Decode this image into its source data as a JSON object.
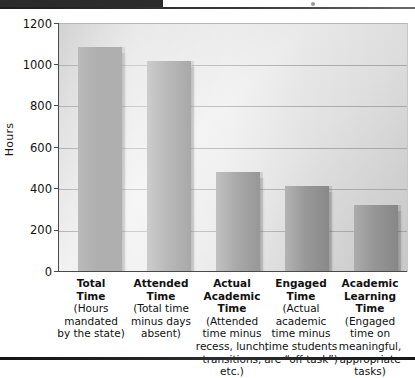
{
  "chart_data": {
    "type": "bar",
    "title": "",
    "xlabel": "",
    "ylabel": "Hours",
    "ylim": [
      0,
      1200
    ],
    "yticks": [
      0,
      200,
      400,
      600,
      800,
      1000,
      1200
    ],
    "ytick_labels": [
      "0",
      "200",
      "400",
      "600",
      "800",
      "1000",
      "1200"
    ],
    "grid": true,
    "legend": "none",
    "categories": [
      "Total Time",
      "Attended Time",
      "Actual Academic Time",
      "Engaged Time",
      "Academic Learning Time"
    ],
    "category_headings": [
      "Total\nTime",
      "Attended\nTime",
      "Actual\nAcademic\nTime",
      "Engaged\nTime",
      "Academic\nLearning\nTime"
    ],
    "category_subtitles": [
      "(Hours mandated by the state)",
      "(Total time minus days absent)",
      "(Attended time minus recess, lunch, transitions, etc.)",
      "(Actual academic time minus time students are “off task”)",
      "(Engaged time on meaningful, appropriate tasks)"
    ],
    "values": [
      1090,
      1020,
      485,
      415,
      325
    ],
    "bar_color": "#9e9e9e",
    "grid_color": "#a9a9a9",
    "axis_color": "#4a4a4a"
  },
  "labels": {
    "y_axis_title": "Hours",
    "cat1_h1": "Total",
    "cat1_h2": "Time",
    "cat1_s1": "(Hours",
    "cat1_s2": "mandated",
    "cat1_s3": "by the state)",
    "cat2_h1": "Attended",
    "cat2_h2": "Time",
    "cat2_s1": "(Total time",
    "cat2_s2": "minus days",
    "cat2_s3": "absent)",
    "cat3_h1": "Actual",
    "cat3_h2": "Academic",
    "cat3_h3": "Time",
    "cat3_s1": "(Attended",
    "cat3_s2": "time minus",
    "cat3_s3": "recess, lunch,",
    "cat3_s4": "transitions,",
    "cat3_s5": "etc.)",
    "cat4_h1": "Engaged",
    "cat4_h2": "Time",
    "cat4_s1": "(Actual",
    "cat4_s2": "academic",
    "cat4_s3": "time minus",
    "cat4_s4": "time students",
    "cat4_s5": "are “off task”)",
    "cat5_h1": "Academic",
    "cat5_h2": "Learning",
    "cat5_h3": "Time",
    "cat5_s1": "(Engaged",
    "cat5_s2": "time on",
    "cat5_s3": "meaningful,",
    "cat5_s4": "appropriate",
    "cat5_s5": "tasks)",
    "tick_1200": "1200",
    "tick_1000": "1000",
    "tick_800": "800",
    "tick_600": "600",
    "tick_400": "400",
    "tick_200": "200",
    "tick_0": "0"
  }
}
